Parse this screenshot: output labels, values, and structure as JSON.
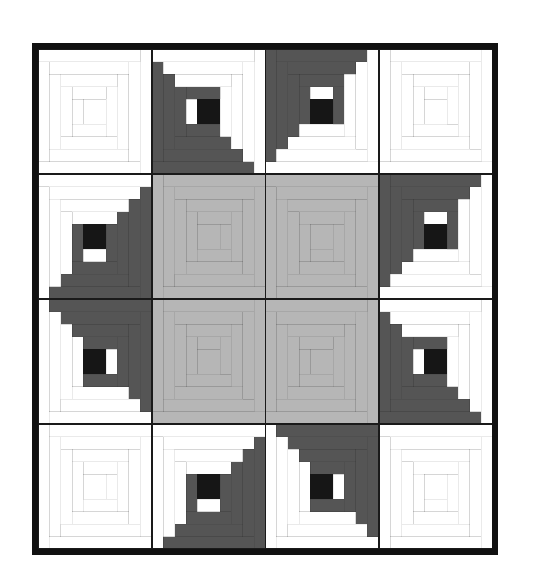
{
  "artwork": {
    "title": "Log Cabin Quilt",
    "pattern_name": "Log Cabin",
    "setting": "Barn Raising / Concentric",
    "grid_rows": 4,
    "grid_columns": 4,
    "total_blocks": 16,
    "logs_per_block": 12,
    "background": "#ffffff"
  },
  "palette": {
    "white": "#ffffff",
    "light_gray": "#b6b6b6",
    "dark_gray": "#555555",
    "black": "#161616",
    "seam_line": "#1a1a1a",
    "binding": "#111111"
  },
  "geometry": {
    "quilt_left": 32,
    "quilt_top": 43,
    "quilt_width": 466,
    "quilt_height": 512,
    "binding_width": 6,
    "block_size": 113.5,
    "center_square_units": 2,
    "block_units": 10
  },
  "chart_data": {
    "type": "heatmap",
    "xlabel": "",
    "ylabel": "",
    "categories": [
      "col-1",
      "col-2",
      "col-3",
      "col-4"
    ],
    "rows": [
      "row-1",
      "row-2",
      "row-3",
      "row-4"
    ],
    "legend": [
      {
        "name": "White logs",
        "color": "#ffffff"
      },
      {
        "name": "Light gray logs",
        "color": "#b6b6b6"
      },
      {
        "name": "Dark gray logs",
        "color": "#555555"
      },
      {
        "name": "Black center square",
        "color": "#161616"
      }
    ],
    "blocks": [
      {
        "id": "r1c1",
        "row": 1,
        "col": 1,
        "kind": "all-white",
        "dark": "#ffffff",
        "light": "#ffffff",
        "center": "#ffffff",
        "rotation": 0
      },
      {
        "id": "r1c2",
        "row": 1,
        "col": 2,
        "kind": "two-tone",
        "dark": "#555555",
        "light": "#ffffff",
        "center": "#161616",
        "rotation": 0
      },
      {
        "id": "r1c3",
        "row": 1,
        "col": 3,
        "kind": "two-tone",
        "dark": "#555555",
        "light": "#ffffff",
        "center": "#161616",
        "rotation": 90
      },
      {
        "id": "r1c4",
        "row": 1,
        "col": 4,
        "kind": "all-white",
        "dark": "#ffffff",
        "light": "#ffffff",
        "center": "#ffffff",
        "rotation": 90
      },
      {
        "id": "r2c1",
        "row": 2,
        "col": 1,
        "kind": "two-tone",
        "dark": "#555555",
        "light": "#ffffff",
        "center": "#161616",
        "rotation": 270
      },
      {
        "id": "r2c2",
        "row": 2,
        "col": 2,
        "kind": "all-gray",
        "dark": "#b6b6b6",
        "light": "#b6b6b6",
        "center": "#b6b6b6",
        "rotation": 180
      },
      {
        "id": "r2c3",
        "row": 2,
        "col": 3,
        "kind": "all-gray",
        "dark": "#b6b6b6",
        "light": "#b6b6b6",
        "center": "#b6b6b6",
        "rotation": 270
      },
      {
        "id": "r2c4",
        "row": 2,
        "col": 4,
        "kind": "two-tone",
        "dark": "#555555",
        "light": "#ffffff",
        "center": "#161616",
        "rotation": 90
      },
      {
        "id": "r3c1",
        "row": 3,
        "col": 1,
        "kind": "two-tone",
        "dark": "#555555",
        "light": "#ffffff",
        "center": "#161616",
        "rotation": 180
      },
      {
        "id": "r3c2",
        "row": 3,
        "col": 2,
        "kind": "all-gray",
        "dark": "#b6b6b6",
        "light": "#b6b6b6",
        "center": "#b6b6b6",
        "rotation": 90
      },
      {
        "id": "r3c3",
        "row": 3,
        "col": 3,
        "kind": "all-gray",
        "dark": "#b6b6b6",
        "light": "#b6b6b6",
        "center": "#b6b6b6",
        "rotation": 0
      },
      {
        "id": "r3c4",
        "row": 3,
        "col": 4,
        "kind": "two-tone",
        "dark": "#555555",
        "light": "#ffffff",
        "center": "#161616",
        "rotation": 0
      },
      {
        "id": "r4c1",
        "row": 4,
        "col": 1,
        "kind": "all-white",
        "dark": "#ffffff",
        "light": "#ffffff",
        "center": "#ffffff",
        "rotation": 180
      },
      {
        "id": "r4c2",
        "row": 4,
        "col": 2,
        "kind": "two-tone",
        "dark": "#555555",
        "light": "#ffffff",
        "center": "#161616",
        "rotation": 270
      },
      {
        "id": "r4c3",
        "row": 4,
        "col": 3,
        "kind": "two-tone",
        "dark": "#555555",
        "light": "#ffffff",
        "center": "#161616",
        "rotation": 180
      },
      {
        "id": "r4c4",
        "row": 4,
        "col": 4,
        "kind": "all-white",
        "dark": "#ffffff",
        "light": "#ffffff",
        "center": "#ffffff",
        "rotation": 270
      }
    ]
  }
}
